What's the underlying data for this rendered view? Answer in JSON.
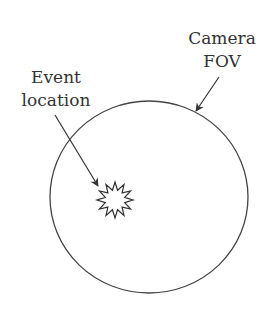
{
  "labels": {
    "event_location": [
      "Event",
      "location"
    ],
    "camera_fov": [
      "Camera",
      "FOV"
    ]
  },
  "colors": {
    "stroke": "#333333",
    "text": "#333333",
    "background": "#ffffff"
  }
}
